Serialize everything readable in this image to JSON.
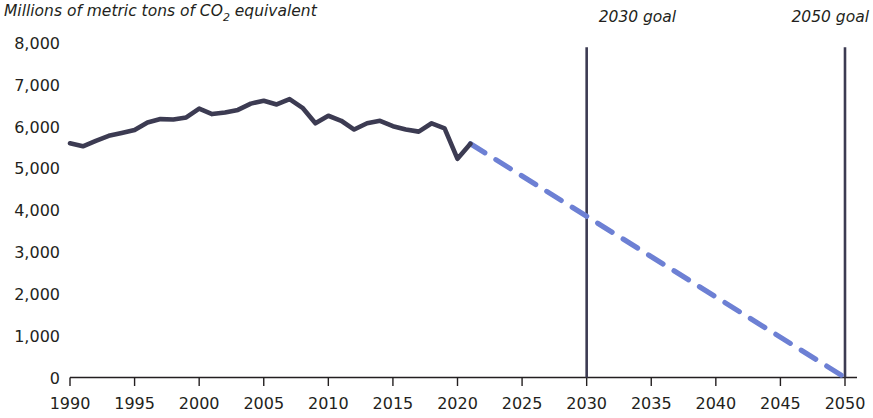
{
  "chart_data": {
    "type": "line",
    "title": "Millions of metric tons of CO2 equivalent",
    "title_display": "Millions of metric tons of CO",
    "title_subscript": "2",
    "title_suffix": " equivalent",
    "xlabel": "",
    "ylabel": "Millions of metric tons of CO2 equivalent",
    "xlim": [
      1990,
      2050
    ],
    "ylim": [
      0,
      8000
    ],
    "grid": false,
    "legend": "none",
    "y_ticks": [
      0,
      1000,
      2000,
      3000,
      4000,
      5000,
      6000,
      7000,
      8000
    ],
    "y_tick_labels": [
      "0",
      "1,000",
      "2,000",
      "3,000",
      "4,000",
      "5,000",
      "6,000",
      "7,000",
      "8,000"
    ],
    "x_ticks": [
      1990,
      1995,
      2000,
      2005,
      2010,
      2015,
      2020,
      2025,
      2030,
      2035,
      2040,
      2045,
      2050
    ],
    "x_tick_labels": [
      "1990",
      "1995",
      "2000",
      "2005",
      "2010",
      "2015",
      "2020",
      "2025",
      "2030",
      "2035",
      "2040",
      "2045",
      "2050"
    ],
    "series": [
      {
        "name": "Historical net greenhouse gas emissions",
        "style": "solid",
        "color": "#3c3b52",
        "x": [
          1990,
          1991,
          1992,
          1993,
          1994,
          1995,
          1996,
          1997,
          1998,
          1999,
          2000,
          2001,
          2002,
          2003,
          2004,
          2005,
          2006,
          2007,
          2008,
          2009,
          2010,
          2011,
          2012,
          2013,
          2014,
          2015,
          2016,
          2017,
          2018,
          2019,
          2020,
          2021
        ],
        "values": [
          5600,
          5530,
          5660,
          5780,
          5850,
          5920,
          6100,
          6180,
          6170,
          6220,
          6430,
          6300,
          6340,
          6400,
          6550,
          6620,
          6530,
          6660,
          6450,
          6080,
          6260,
          6140,
          5930,
          6080,
          6140,
          6010,
          5930,
          5880,
          6080,
          5960,
          5230,
          5590
        ]
      },
      {
        "name": "Projected path to goals",
        "style": "dashed",
        "color": "#6d80d4",
        "x": [
          2021,
          2050
        ],
        "values": [
          5590,
          0
        ]
      }
    ],
    "annotations": [
      {
        "name": "2030 goal",
        "label": "2030 goal",
        "x": 2030,
        "type": "vertical-line",
        "color": "#3c3b52",
        "y_top": 7900,
        "y_bottom": 0
      },
      {
        "name": "2050 goal",
        "label": "2050 goal",
        "x": 2050,
        "type": "vertical-line",
        "color": "#3c3b52",
        "y_top": 7900,
        "y_bottom": 0
      }
    ]
  },
  "colors": {
    "historical_line": "#3c3b52",
    "projection_line": "#6d80d4",
    "axis": "#231f20",
    "background": "#ffffff"
  }
}
